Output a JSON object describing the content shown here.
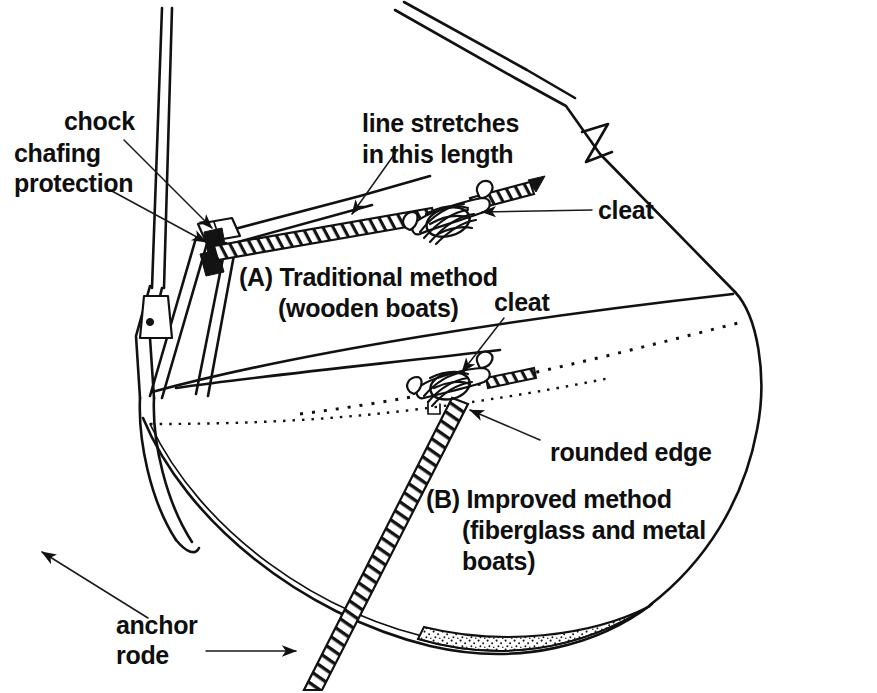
{
  "figure": {
    "background_color": "#ffffff",
    "ink_color": "#111111",
    "width": 877,
    "height": 693
  },
  "labels": {
    "chock": "chock",
    "chafing": "chafing",
    "protection": "protection",
    "line_stretches_1": "line stretches",
    "line_stretches_2": "in this length",
    "cleat_top": "cleat",
    "method_a_1": "(A) Traditional method",
    "method_a_2": "(wooden boats)",
    "cleat_bottom": "cleat",
    "rounded_edge": "rounded edge",
    "method_b_1": "(B) Improved method",
    "method_b_2": "(fiberglass and metal",
    "method_b_3": "boats)",
    "anchor_1": "anchor",
    "anchor_2": "rode"
  },
  "icons": {
    "arrow_chock": "arrow-icon",
    "arrow_chafing": "arrow-icon",
    "arrow_line_stretches": "arrow-icon",
    "arrow_cleat_top": "arrow-icon",
    "arrow_cleat_bottom": "arrow-icon",
    "arrow_rounded_edge": "arrow-icon",
    "arrow_anchor_rode": "arrow-icon",
    "break_symbol": "break-mark-icon"
  },
  "parts": {
    "forestay": "forestay",
    "bow_pulpit": "bow-pulpit-rail",
    "stem_fitting": "stem-head-fitting",
    "deck_edge": "deck-edge",
    "toe_rail": "toe-rail-ticks",
    "waterline": "waterline-dotted",
    "hull": "hull-outline",
    "keel": "keel-stippled",
    "cleat_a": "horn-cleat-traditional",
    "cleat_b": "horn-cleat-improved",
    "rode_a": "anchor-rode-upper",
    "rode_b": "anchor-rode-lower",
    "chafe_gear": "chafing-protection-sleeve"
  }
}
